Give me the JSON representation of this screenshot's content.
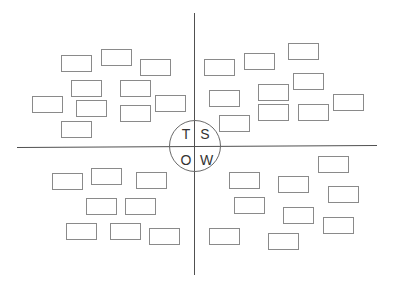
{
  "diagram": {
    "type": "swot-quadrant",
    "colors": {
      "axis": "#505050",
      "box_border": "#8a8a8a",
      "circle": "#6a6a6a",
      "letter": "#333333"
    },
    "axes": {
      "vertical": {
        "x": 194,
        "y1": 13,
        "y2": 275
      },
      "horizontal": {
        "x1": 17,
        "x2": 377,
        "y1": 147,
        "y2": 145
      }
    },
    "center_circle": {
      "cx": 195,
      "cy": 146,
      "r": 26,
      "letters": [
        {
          "id": "t",
          "text": "T",
          "x": 180,
          "y": 127
        },
        {
          "id": "s",
          "text": "S",
          "x": 199,
          "y": 127
        },
        {
          "id": "o",
          "text": "O",
          "x": 180,
          "y": 153
        },
        {
          "id": "w",
          "text": "W",
          "x": 200,
          "y": 153
        }
      ]
    },
    "quadrants": {
      "top_left": [
        {
          "x": 61,
          "y": 55
        },
        {
          "x": 101,
          "y": 49
        },
        {
          "x": 140,
          "y": 59
        },
        {
          "x": 71,
          "y": 80
        },
        {
          "x": 120,
          "y": 80
        },
        {
          "x": 32,
          "y": 96
        },
        {
          "x": 76,
          "y": 100
        },
        {
          "x": 155,
          "y": 95
        },
        {
          "x": 120,
          "y": 105
        },
        {
          "x": 61,
          "y": 121
        }
      ],
      "top_right": [
        {
          "x": 204,
          "y": 59
        },
        {
          "x": 244,
          "y": 53
        },
        {
          "x": 288,
          "y": 43
        },
        {
          "x": 209,
          "y": 90
        },
        {
          "x": 258,
          "y": 84
        },
        {
          "x": 293,
          "y": 73
        },
        {
          "x": 333,
          "y": 94
        },
        {
          "x": 258,
          "y": 104
        },
        {
          "x": 298,
          "y": 104
        },
        {
          "x": 219,
          "y": 115
        }
      ],
      "bottom_left": [
        {
          "x": 52,
          "y": 173
        },
        {
          "x": 91,
          "y": 168
        },
        {
          "x": 136,
          "y": 172
        },
        {
          "x": 86,
          "y": 198
        },
        {
          "x": 125,
          "y": 198
        },
        {
          "x": 66,
          "y": 223
        },
        {
          "x": 110,
          "y": 223
        },
        {
          "x": 149,
          "y": 228
        }
      ],
      "bottom_right": [
        {
          "x": 318,
          "y": 156
        },
        {
          "x": 229,
          "y": 172
        },
        {
          "x": 278,
          "y": 176
        },
        {
          "x": 328,
          "y": 186
        },
        {
          "x": 234,
          "y": 197
        },
        {
          "x": 283,
          "y": 207
        },
        {
          "x": 323,
          "y": 217
        },
        {
          "x": 209,
          "y": 228
        },
        {
          "x": 268,
          "y": 233
        }
      ]
    }
  }
}
